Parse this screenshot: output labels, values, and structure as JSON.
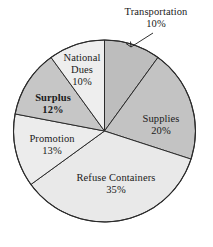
{
  "chart_data": {
    "type": "pie",
    "title": "",
    "subtitle": "",
    "xlabel": "",
    "ylabel": "",
    "legend_position": "none",
    "grid": false,
    "units": "percent",
    "start_angle_deg": 0,
    "direction": "clockwise",
    "categories": [
      "Transportation",
      "Supplies",
      "Refuse Containers",
      "Promotion",
      "Surplus",
      "National Dues"
    ],
    "values": [
      10,
      20,
      35,
      13,
      12,
      10
    ],
    "slices": [
      {
        "label": "Transportation",
        "value": 10,
        "value_text": "10%",
        "color": "#bdbdbd",
        "start_deg": 0,
        "end_deg": 36,
        "label_placement": "outside",
        "has_leader_line": true
      },
      {
        "label": "Supplies",
        "value": 20,
        "value_text": "20%",
        "color": "#c3c3c3",
        "start_deg": 36,
        "end_deg": 108,
        "label_placement": "inside",
        "has_leader_line": false
      },
      {
        "label": "Refuse Containers",
        "value": 35,
        "value_text": "35%",
        "color": "#e9e9e9",
        "start_deg": 108,
        "end_deg": 234,
        "label_placement": "inside",
        "has_leader_line": false
      },
      {
        "label": "Promotion",
        "value": 13,
        "value_text": "13%",
        "color": "#ececec",
        "start_deg": 234,
        "end_deg": 280.8,
        "label_placement": "inside",
        "has_leader_line": false
      },
      {
        "label": "Surplus",
        "value": 12,
        "value_text": "12%",
        "color": "#c6c6c6",
        "start_deg": 280.8,
        "end_deg": 324,
        "label_placement": "inside",
        "has_leader_line": false
      },
      {
        "label": "National Dues",
        "value": 10,
        "value_text": "10%",
        "color": "#eeeeee",
        "start_deg": 324,
        "end_deg": 360,
        "label_placement": "inside",
        "has_leader_line": false
      }
    ]
  },
  "labels": {
    "transportation": {
      "name": "Transportation",
      "pct": "10%"
    },
    "supplies": {
      "name": "Supplies",
      "pct": "20%"
    },
    "refuse": {
      "name": "Refuse Containers",
      "pct": "35%"
    },
    "promotion": {
      "name": "Promotion",
      "pct": "13%"
    },
    "surplus": {
      "name": "Surplus",
      "pct": "12%"
    },
    "national_dues": {
      "name_line1": "National",
      "name_line2": "Dues",
      "pct": "10%"
    }
  },
  "colors": {
    "outline": "#2b2b2b",
    "background": "#ffffff",
    "text": "#1a1a1a",
    "medium_gray": "#c3c3c3",
    "light_gray": "#e9e9e9"
  }
}
